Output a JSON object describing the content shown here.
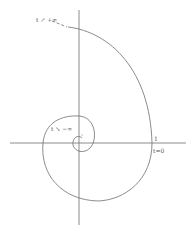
{
  "diagram": {
    "type": "logarithmic-spiral",
    "labels": {
      "plus_infinity": "t ↗ +∞",
      "minus_infinity": "t ↘ −∞",
      "one": "1",
      "t_zero": "t=0"
    },
    "axes": {
      "horizontal": "x-axis",
      "vertical": "y-axis"
    },
    "colors": {
      "line": "#6e6e6e",
      "text": "#555555",
      "background": "#ffffff"
    }
  }
}
